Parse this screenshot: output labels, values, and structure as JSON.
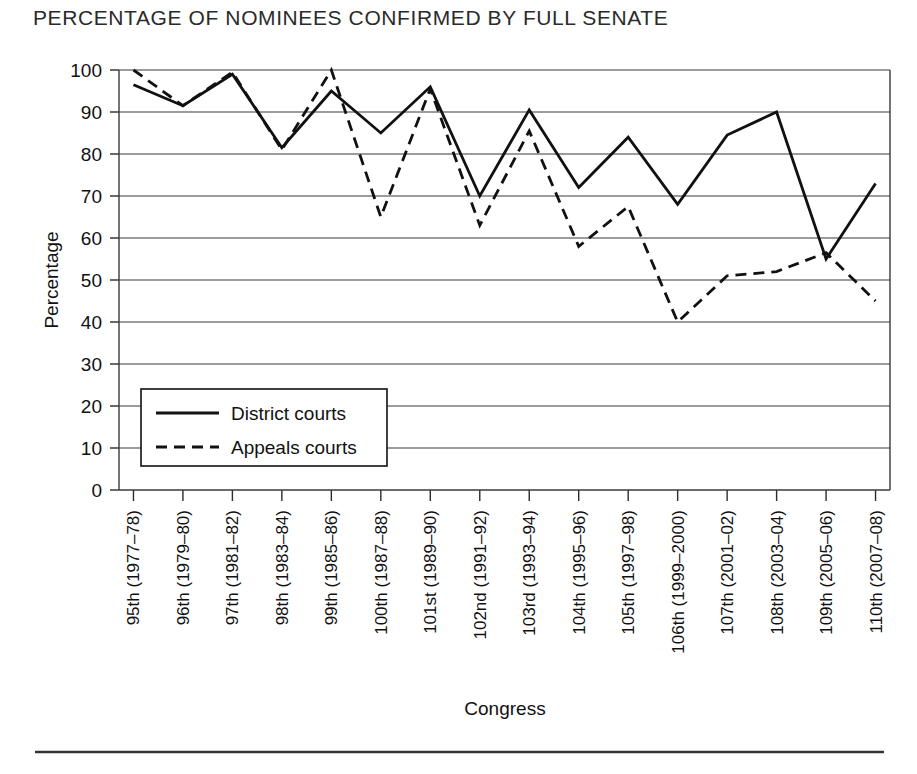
{
  "chart_data": {
    "type": "line",
    "title": "PERCENTAGE OF NOMINEES CONFIRMED BY FULL SENATE",
    "xlabel": "Congress",
    "ylabel": "Percentage",
    "ylim": [
      0,
      100
    ],
    "ytick_step": 10,
    "yticks": [
      "0",
      "10",
      "20",
      "30",
      "40",
      "50",
      "60",
      "70",
      "80",
      "90",
      "100"
    ],
    "grid": true,
    "legend_position": "inner lower-left",
    "categories": [
      "95th (1977–78)",
      "96th (1979–80)",
      "97th (1981–82)",
      "98th (1983–84)",
      "99th (1985–86)",
      "100th (1987–88)",
      "101st (1989–90)",
      "102nd (1991–92)",
      "103rd (1993–94)",
      "104th (1995–96)",
      "105th (1997–98)",
      "106th (1999–2000)",
      "107th (2001–02)",
      "108th (2003–04)",
      "109th (2005–06)",
      "110th (2007–08)"
    ],
    "series": [
      {
        "name": "District courts",
        "style": "solid",
        "color": "#111111",
        "values": [
          96.5,
          91.5,
          99.0,
          81.5,
          95.0,
          85.0,
          96.0,
          70.0,
          90.5,
          72.0,
          84.0,
          68.0,
          84.5,
          90.0,
          55.0,
          73.0
        ]
      },
      {
        "name": "Appeals courts",
        "style": "dashed",
        "color": "#111111",
        "values": [
          100.0,
          91.5,
          99.5,
          81.0,
          100.0,
          65.0,
          95.5,
          63.0,
          85.5,
          58.0,
          67.5,
          40.0,
          51.0,
          52.0,
          56.5,
          45.0
        ]
      }
    ]
  },
  "legend": {
    "entries": [
      {
        "label": "District courts",
        "style": "solid"
      },
      {
        "label": "Appeals courts",
        "style": "dashed"
      }
    ]
  }
}
